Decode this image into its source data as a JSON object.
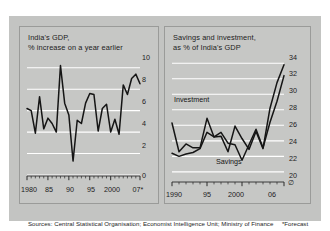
{
  "figure": {
    "background_color": "#ffffff",
    "plate_color": "#c3c4c2",
    "panel_color": "#c6c7c5",
    "line_color": "#151515",
    "gridline_color": "#ffffff",
    "source_note": "Sources: Central Statistical Organisation; Economist Intelligence Unit; Ministry of Finance",
    "forecast_note": "*Forecast"
  },
  "chart_data": [
    {
      "type": "line",
      "id": "india-gdp-growth",
      "title": "India's GDP,\n% increase on a year earlier",
      "xlabel": "",
      "ylabel": "",
      "ylim": [
        0,
        11
      ],
      "yticks": [
        0,
        2,
        4,
        6,
        8,
        10
      ],
      "ytick_labels": [
        "0",
        "2",
        "4",
        "6",
        "8",
        "10"
      ],
      "xlim": [
        1980,
        2007
      ],
      "xticks": [
        1980,
        1985,
        1990,
        1995,
        2000,
        2007
      ],
      "xtick_labels": [
        "1980",
        "85",
        "90",
        "95",
        "2000",
        "07*"
      ],
      "grid": true,
      "legend": "none",
      "series": [
        {
          "name": "GDP growth",
          "x": [
            1980,
            1981,
            1982,
            1983,
            1984,
            1985,
            1986,
            1987,
            1988,
            1989,
            1990,
            1991,
            1992,
            1993,
            1994,
            1995,
            1996,
            1997,
            1998,
            1999,
            2000,
            2001,
            2002,
            2003,
            2004,
            2005,
            2006,
            2007
          ],
          "values": [
            6.2,
            6.0,
            3.9,
            7.3,
            4.3,
            5.3,
            4.8,
            4.0,
            10.2,
            6.7,
            5.6,
            1.3,
            5.1,
            4.8,
            6.7,
            7.6,
            7.5,
            4.1,
            6.2,
            6.6,
            4.0,
            5.2,
            3.8,
            8.4,
            7.5,
            9.0,
            9.4,
            8.5
          ]
        }
      ]
    },
    {
      "type": "line",
      "id": "india-savings-investment",
      "title": "Savings and investment,\nas % of India's GDP",
      "xlabel": "",
      "ylabel": "",
      "ylim": [
        19.6,
        34.8
      ],
      "yticks": [
        20,
        22,
        24,
        26,
        28,
        30,
        32,
        34
      ],
      "ytick_labels": [
        "20",
        "22",
        "24",
        "26",
        "28",
        "30",
        "32",
        "34"
      ],
      "xlim": [
        1990,
        2006
      ],
      "xticks": [
        1990,
        1995,
        2000,
        2006
      ],
      "xtick_labels": [
        "1990",
        "95",
        "2000",
        "06"
      ],
      "grid": true,
      "axis_break": true,
      "legend": "inline",
      "series": [
        {
          "name": "Investment",
          "label": "Investment",
          "x": [
            1990,
            1991,
            1992,
            1993,
            1994,
            1995,
            1996,
            1997,
            1998,
            1999,
            2000,
            2001,
            2002,
            2003,
            2004,
            2005,
            2006
          ],
          "values": [
            26.3,
            22.6,
            23.6,
            23.1,
            23.1,
            26.9,
            24.5,
            24.6,
            22.6,
            25.9,
            24.3,
            22.9,
            25.2,
            23.0,
            28.2,
            31.5,
            33.8
          ]
        },
        {
          "name": "Savings",
          "label": "Savings",
          "x": [
            1990,
            1991,
            1992,
            1993,
            1994,
            1995,
            1996,
            1997,
            1998,
            1999,
            2000,
            2001,
            2002,
            2003,
            2004,
            2005,
            2006
          ],
          "values": [
            22.4,
            22.0,
            22.3,
            22.5,
            23.0,
            25.1,
            24.5,
            25.1,
            23.7,
            23.5,
            21.5,
            23.5,
            25.5,
            23.1,
            26.4,
            29.1,
            32.4
          ]
        }
      ]
    }
  ]
}
